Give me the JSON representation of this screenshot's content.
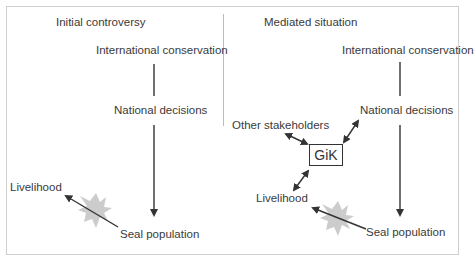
{
  "panels": {
    "left": {
      "title": "Initial controversy",
      "nodes": {
        "international": "International conservation",
        "national": "National decisions",
        "livelihood": "Livelihood",
        "seal": "Seal population"
      }
    },
    "right": {
      "title": "Mediated situation",
      "nodes": {
        "international": "International conservation",
        "national": "National decisions",
        "other": "Other stakeholders",
        "gik": "GiK",
        "livelihood": "Livelihood",
        "seal": "Seal population"
      }
    }
  },
  "colors": {
    "line": "#333333",
    "conflict_star": "#cccccc",
    "border": "#cfcfcf"
  }
}
